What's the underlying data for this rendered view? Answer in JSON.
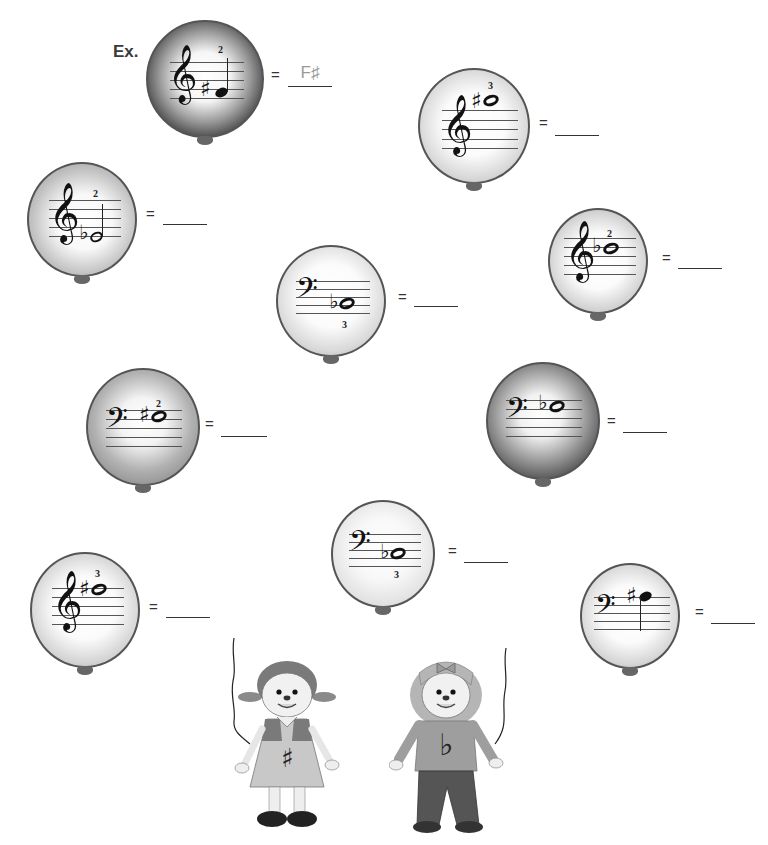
{
  "worksheet": {
    "example_label": "Ex.",
    "equals_sign": "=",
    "colors": {
      "dark_balloon": "#4a4a4a",
      "mid_balloon": "#8a8a8a",
      "light_balloon": "#bdbdbd",
      "answer_text": "#9a9a9a"
    }
  },
  "balloons": [
    {
      "id": "example",
      "clef": "treble",
      "accidental": "♯",
      "note": "quarter",
      "finger": "2",
      "finger_pos": "above",
      "answer": "F♯",
      "shade": "dark"
    },
    {
      "id": "b1",
      "clef": "treble",
      "accidental": "♯",
      "note": "whole",
      "finger": "3",
      "finger_pos": "above",
      "answer": "",
      "shade": "light"
    },
    {
      "id": "b2",
      "clef": "treble",
      "accidental": "♭",
      "note": "half",
      "finger": "2",
      "finger_pos": "above",
      "answer": "",
      "shade": "mid"
    },
    {
      "id": "b3",
      "clef": "treble",
      "accidental": "♭",
      "note": "whole",
      "finger": "2",
      "finger_pos": "above",
      "answer": "",
      "shade": "light"
    },
    {
      "id": "b4",
      "clef": "bass",
      "accidental": "♭",
      "note": "whole",
      "finger": "3",
      "finger_pos": "below",
      "answer": "",
      "shade": "light"
    },
    {
      "id": "b5",
      "clef": "bass",
      "accidental": "♯",
      "note": "whole",
      "finger": "2",
      "finger_pos": "above",
      "answer": "",
      "shade": "mid"
    },
    {
      "id": "b6",
      "clef": "bass",
      "accidental": "♭",
      "note": "whole",
      "finger": "",
      "finger_pos": "none",
      "answer": "",
      "shade": "dark"
    },
    {
      "id": "b7",
      "clef": "bass",
      "accidental": "♭",
      "note": "whole",
      "finger": "3",
      "finger_pos": "below",
      "answer": "",
      "shade": "light"
    },
    {
      "id": "b8",
      "clef": "treble",
      "accidental": "♯",
      "note": "whole",
      "finger": "3",
      "finger_pos": "above",
      "answer": "",
      "shade": "light"
    },
    {
      "id": "b9",
      "clef": "bass",
      "accidental": "♯",
      "note": "quarter",
      "finger": "",
      "finger_pos": "none",
      "answer": "",
      "shade": "light"
    }
  ],
  "glyphs": {
    "treble_clef": "𝄞",
    "bass_clef": "𝄢",
    "sharp": "♯",
    "flat": "♭"
  },
  "characters": [
    {
      "name": "sharp-girl",
      "symbol": "♯",
      "description": "girl with pigtails in dress"
    },
    {
      "name": "flat-girl",
      "symbol": "♭",
      "description": "girl with bow in sweater and pants"
    }
  ]
}
